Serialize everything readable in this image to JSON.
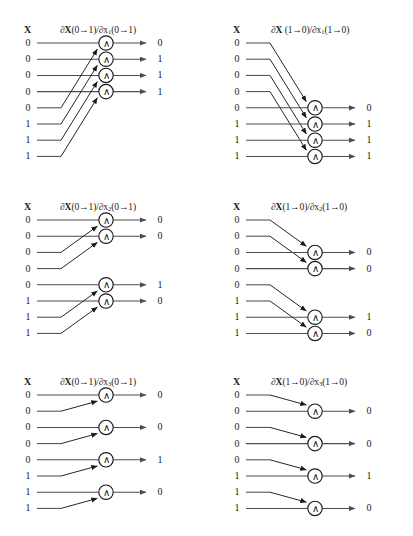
{
  "figure": {
    "background": "#ffffff",
    "line_color": "#4d4d4d",
    "gate_color": "#1a1a1a",
    "text_color": "#1a1a1a",
    "gate_symbol": "∧",
    "gate_symbol_name": "and-gate-wedge",
    "column_header": "X",
    "input_count": 8,
    "gate_count": 4
  },
  "panels": [
    {
      "id": "p1",
      "title_html": "∂<span class=\"b\">X</span>(0→1)/∂x<sub>1</sub>(0→1)",
      "title_text": "∂X(0→1)/∂x1(0→1)",
      "header": "X",
      "inputs": [
        "0",
        "0",
        "0",
        "0",
        "0",
        "1",
        "1",
        "1"
      ],
      "outputs": [
        "0",
        "1",
        "1",
        "1"
      ],
      "gate_rows": [
        1,
        2,
        3,
        4
      ],
      "direction": "up",
      "pairs": [
        [
          5,
          1
        ],
        [
          6,
          2
        ],
        [
          7,
          3
        ],
        [
          8,
          4
        ]
      ]
    },
    {
      "id": "p2",
      "title_html": "∂<span class=\"b\">X</span> (1→0)/∂x<sub>1</sub>(1→0)",
      "title_text": "∂X (1→0)/∂x1(1→0)",
      "header": "X",
      "inputs": [
        "0",
        "0",
        "0",
        "0",
        "0",
        "1",
        "1",
        "1"
      ],
      "outputs": [
        "0",
        "1",
        "1",
        "1"
      ],
      "gate_rows": [
        5,
        6,
        7,
        8
      ],
      "direction": "down",
      "pairs": [
        [
          1,
          5
        ],
        [
          2,
          6
        ],
        [
          3,
          7
        ],
        [
          4,
          8
        ]
      ]
    },
    {
      "id": "p3",
      "title_html": "∂<span class=\"b\">X</span>(0→1)/∂x<sub>2</sub>(0→1)",
      "title_text": "∂X(0→1)/∂x2(0→1)",
      "header": "X",
      "inputs": [
        "0",
        "0",
        "0",
        "0",
        "0",
        "1",
        "1",
        "1"
      ],
      "outputs": [
        "0",
        "0",
        "1",
        "0"
      ],
      "gate_rows": [
        1,
        2,
        5,
        6
      ],
      "direction": "up",
      "pairs": [
        [
          3,
          1
        ],
        [
          4,
          2
        ],
        [
          7,
          5
        ],
        [
          8,
          6
        ]
      ]
    },
    {
      "id": "p4",
      "title_html": "∂<span class=\"b\">X</span>(1→0)/∂x<sub>2</sub>(1→0)",
      "title_text": "∂X(1→0)/∂x2(1→0)",
      "header": "X",
      "inputs": [
        "0",
        "0",
        "0",
        "0",
        "0",
        "1",
        "1",
        "1"
      ],
      "outputs": [
        "0",
        "0",
        "1",
        "0"
      ],
      "gate_rows": [
        3,
        4,
        7,
        8
      ],
      "direction": "down",
      "pairs": [
        [
          1,
          3
        ],
        [
          2,
          4
        ],
        [
          5,
          7
        ],
        [
          6,
          8
        ]
      ]
    },
    {
      "id": "p5",
      "title_html": "∂<span class=\"b\">X</span>(0→1)/∂x<sub>3</sub>(0→1)",
      "title_text": "∂X(0→1)/∂x3(0→1)",
      "header": "X",
      "inputs": [
        "0",
        "0",
        "0",
        "0",
        "0",
        "1",
        "1",
        "1"
      ],
      "outputs": [
        "0",
        "0",
        "1",
        "0"
      ],
      "gate_rows": [
        1,
        3,
        5,
        7
      ],
      "direction": "up",
      "pairs": [
        [
          2,
          1
        ],
        [
          4,
          3
        ],
        [
          6,
          5
        ],
        [
          8,
          7
        ]
      ]
    },
    {
      "id": "p6",
      "title_html": "∂<span class=\"b\">X</span>(1→0)/∂x<sub>3</sub>(1→0)",
      "title_text": "∂X(1→0)/∂x3(1→0)",
      "header": "X",
      "inputs": [
        "0",
        "0",
        "0",
        "0",
        "0",
        "1",
        "1",
        "1"
      ],
      "outputs": [
        "0",
        "0",
        "1",
        "0"
      ],
      "gate_rows": [
        2,
        4,
        6,
        8
      ],
      "direction": "down",
      "pairs": [
        [
          1,
          2
        ],
        [
          3,
          4
        ],
        [
          5,
          6
        ],
        [
          7,
          8
        ]
      ]
    }
  ]
}
